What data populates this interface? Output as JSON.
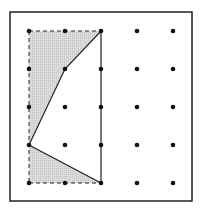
{
  "diagram": {
    "type": "geoboard-dot-grid",
    "grid": {
      "columns": 5,
      "rows": 5,
      "x": [
        29,
        65,
        101,
        137,
        173
      ],
      "y": [
        31,
        69,
        107,
        145,
        183
      ]
    },
    "frame": {
      "x": 10,
      "y": 12,
      "width": 182,
      "height": 189
    },
    "dashed_rectangle": {
      "from": [
        0,
        0
      ],
      "to": [
        2,
        4
      ]
    },
    "polygon_solid_path": [
      [
        2,
        0
      ],
      [
        1,
        1
      ],
      [
        0,
        3
      ],
      [
        2,
        4
      ]
    ],
    "shaded_regions": [
      {
        "name": "upper-triangle-region",
        "points": [
          [
            0,
            0
          ],
          [
            2,
            0
          ],
          [
            1,
            1
          ],
          [
            0,
            3
          ]
        ]
      },
      {
        "name": "lower-triangle-region",
        "points": [
          [
            0,
            3
          ],
          [
            2,
            4
          ],
          [
            0,
            4
          ]
        ]
      }
    ],
    "colors": {
      "frame": "#222222",
      "dot": "#111111",
      "line": "#222222",
      "shade": "#d6d6d6"
    }
  }
}
